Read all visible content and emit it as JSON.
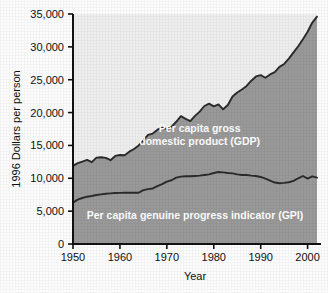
{
  "chart_data": {
    "type": "area",
    "title": "",
    "xlabel": "Year",
    "ylabel": "1996 Dollars per person",
    "xlim": [
      1950,
      2002
    ],
    "ylim": [
      0,
      35000
    ],
    "grid": false,
    "legend_position": "inline-annotations",
    "y_ticks": [
      0,
      5000,
      10000,
      15000,
      20000,
      25000,
      30000,
      35000
    ],
    "y_tick_labels": [
      "0",
      "5,000",
      "10,000",
      "15,000",
      "20,000",
      "25,000",
      "30,000",
      "35,000"
    ],
    "x_ticks": [
      1950,
      1960,
      1970,
      1980,
      1990,
      2000
    ],
    "x_tick_labels": [
      "1950",
      "1960",
      "1970",
      "1980",
      "1990",
      "2000"
    ],
    "annotations": [
      {
        "name": "gdp-label",
        "text_line1": "Per capita gross",
        "text_line2": "domestic product (GDP)",
        "x": 1977,
        "y": 17000
      },
      {
        "name": "gpi-label",
        "text": "Per capita genuine progress indicator (GPI)",
        "x": 1976,
        "y": 3800
      }
    ],
    "x": [
      1950,
      1951,
      1952,
      1953,
      1954,
      1955,
      1956,
      1957,
      1958,
      1959,
      1960,
      1961,
      1962,
      1963,
      1964,
      1965,
      1966,
      1967,
      1968,
      1969,
      1970,
      1971,
      1972,
      1973,
      1974,
      1975,
      1976,
      1977,
      1978,
      1979,
      1980,
      1981,
      1982,
      1983,
      1984,
      1985,
      1986,
      1987,
      1988,
      1989,
      1990,
      1991,
      1992,
      1993,
      1994,
      1995,
      1996,
      1997,
      1998,
      1999,
      2000,
      2001,
      2002
    ],
    "series": [
      {
        "name": "Per capita gross domestic product (GDP)",
        "color": "#d8d8d8",
        "line_color": "#2b2b2b",
        "values": [
          11900,
          12300,
          12550,
          12800,
          12450,
          13150,
          13200,
          13100,
          12750,
          13400,
          13550,
          13500,
          14050,
          14450,
          15000,
          15800,
          16600,
          16800,
          17400,
          17700,
          17500,
          17850,
          18600,
          19450,
          19050,
          18700,
          19500,
          20150,
          21000,
          21350,
          20950,
          21250,
          20500,
          21150,
          22450,
          23050,
          23500,
          24050,
          24850,
          25500,
          25700,
          25300,
          25800,
          26150,
          26950,
          27400,
          28200,
          29150,
          30100,
          31150,
          32300,
          33700,
          34600
        ]
      },
      {
        "name": "Per capita genuine progress indicator (GPI)",
        "color": "#9a9a9a",
        "line_color": "#2b2b2b",
        "values": [
          6300,
          6750,
          7000,
          7200,
          7300,
          7450,
          7550,
          7650,
          7700,
          7750,
          7780,
          7800,
          7800,
          7800,
          7800,
          8200,
          8350,
          8450,
          8800,
          9100,
          9500,
          9700,
          10100,
          10250,
          10300,
          10300,
          10350,
          10400,
          10500,
          10600,
          10800,
          10950,
          10900,
          10800,
          10750,
          10600,
          10500,
          10500,
          10400,
          10350,
          10200,
          9950,
          9650,
          9350,
          9250,
          9300,
          9400,
          9600,
          10000,
          10350,
          9950,
          10300,
          10100
        ]
      }
    ]
  },
  "axis": {
    "y_title": "1996 Dollars per person",
    "x_title": "Year"
  },
  "labels": {
    "gdp_line1": "Per capita gross",
    "gdp_line2": "domestic product (GDP)",
    "gpi": "Per capita genuine progress indicator (GPI)"
  },
  "colors": {
    "gdp_band": "#d8d8d8",
    "gpi_band": "#9a9a9a",
    "curve": "#2b2b2b",
    "axis": "#111111",
    "text": "#111111",
    "label_text": "#ffffff"
  }
}
